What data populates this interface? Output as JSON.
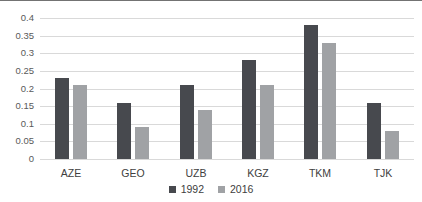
{
  "chart_data": {
    "type": "bar",
    "title": "",
    "xlabel": "",
    "ylabel": "",
    "categories": [
      "AZE",
      "GEO",
      "UZB",
      "KGZ",
      "TKM",
      "TJK"
    ],
    "series": [
      {
        "name": "1992",
        "color": "#47494e",
        "values": [
          0.23,
          0.16,
          0.21,
          0.28,
          0.38,
          0.16
        ]
      },
      {
        "name": "2016",
        "color": "#a0a2a5",
        "values": [
          0.21,
          0.09,
          0.14,
          0.21,
          0.33,
          0.08
        ]
      }
    ],
    "ylim": [
      0,
      0.4
    ],
    "yticks": [
      {
        "value": 0,
        "label": "0"
      },
      {
        "value": 0.05,
        "label": "0.05"
      },
      {
        "value": 0.1,
        "label": "0.1"
      },
      {
        "value": 0.15,
        "label": "0.15"
      },
      {
        "value": 0.2,
        "label": "0.2"
      },
      {
        "value": 0.25,
        "label": "0.25"
      },
      {
        "value": 0.3,
        "label": "0.3"
      },
      {
        "value": 0.35,
        "label": "0.35"
      },
      {
        "value": 0.4,
        "label": "0.4"
      }
    ],
    "grid": true,
    "legend_position": "bottom"
  },
  "colors": {
    "background": "#ffffff",
    "border_top": "#737373",
    "gridline": "#d9d9d9",
    "axis_text": "#595959",
    "category_text": "#404040"
  }
}
